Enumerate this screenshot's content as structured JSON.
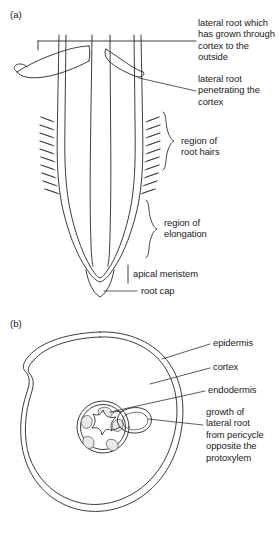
{
  "figure": {
    "background_color": "#ffffff",
    "ink_color": "#262626",
    "panels": [
      {
        "id": "a",
        "tag": "(a)",
        "caption_topic": "longitudinal view of root tip showing lateral roots, root hairs, regions of elongation, apical meristem and root cap",
        "labels": [
          {
            "name": "lateral-root-grown-through-cortex",
            "text": "lateral root which\nhas grown through\ncortex to the\noutside",
            "connector": "horizontal-line-with-vertical-drop"
          },
          {
            "name": "lateral-root-penetrating-cortex",
            "text": "lateral root\npenetrating the\ncortex",
            "connector": "diagonal-line"
          },
          {
            "name": "region-of-root-hairs",
            "text": "region of\nroot hairs",
            "connector": "curly-brace"
          },
          {
            "name": "region-of-elongation",
            "text": "region of\nelongation",
            "connector": "curly-brace"
          },
          {
            "name": "apical-meristem",
            "text": "apical meristem",
            "connector": "short-vertical-bar"
          },
          {
            "name": "root-cap",
            "text": "root cap",
            "connector": "diagonal-line"
          }
        ]
      },
      {
        "id": "b",
        "tag": "(b)",
        "caption_topic": "transverse section of root showing epidermis, cortex, endodermis and emerging lateral root from pericycle",
        "labels": [
          {
            "name": "epidermis",
            "text": "epidermis",
            "connector": "leader-line"
          },
          {
            "name": "cortex",
            "text": "cortex",
            "connector": "leader-line"
          },
          {
            "name": "endodermis",
            "text": "endodermis",
            "connector": "leader-line"
          },
          {
            "name": "growth-of-lateral-root",
            "text": "growth of\nlateral root\nfrom pericycle\nopposite the\nprotoxylem",
            "connector": "leader-line"
          }
        ]
      }
    ]
  }
}
